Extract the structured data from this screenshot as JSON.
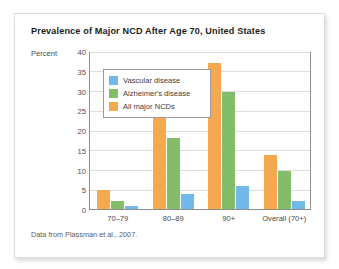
{
  "figure": {
    "title": "Prevalence of Major NCD After Age 70, United States",
    "source_note": "Data from Plassman et al., 2007."
  },
  "legend": {
    "position": "inside-top-left",
    "items": [
      {
        "label": "Vascular disease",
        "color": "#72b8e8"
      },
      {
        "label": "Alzheimer's disease",
        "color": "#84bd6a"
      },
      {
        "label": "All major NCDs",
        "color": "#f5a94e"
      }
    ]
  },
  "chart_data": {
    "type": "bar",
    "title": "Prevalence of Major NCD After Age 70, United States",
    "xlabel": "",
    "ylabel": "Percent",
    "ylim": [
      0,
      40
    ],
    "ytick_step": 5,
    "yticks": [
      0,
      5,
      10,
      15,
      20,
      25,
      30,
      35,
      40
    ],
    "grid": true,
    "categories": [
      "70–79",
      "80–89",
      "90+",
      "Overall (70+)"
    ],
    "series": [
      {
        "name": "All major NCDs",
        "color": "#f5a94e",
        "values": [
          4.8,
          24.0,
          37.0,
          13.7
        ]
      },
      {
        "name": "Alzheimer's disease",
        "color": "#84bd6a",
        "values": [
          2.0,
          18.0,
          29.5,
          9.5
        ]
      },
      {
        "name": "Vascular disease",
        "color": "#72b8e8",
        "values": [
          0.8,
          3.9,
          5.9,
          2.0
        ]
      }
    ],
    "annotations": [
      "Data from Plassman et al., 2007."
    ]
  }
}
